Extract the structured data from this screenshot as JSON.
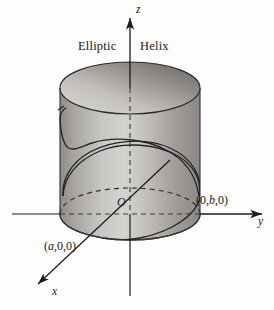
{
  "figure": {
    "title_part_1": "Elliptic",
    "title_part_2": "Helix",
    "background_color": "#fdfdfc",
    "ink_color": "#1b1b1b"
  },
  "axes": {
    "z_label": "z",
    "y_label": "y",
    "x_label": "x",
    "origin_label": "O"
  },
  "points": [
    {
      "name": "y-intercept",
      "label_prefix": "(0,",
      "label_var": "b",
      "label_suffix": ",0)",
      "label_full": "(0,b,0)"
    },
    {
      "name": "x-intercept",
      "label_prefix": "(",
      "label_var": "a",
      "label_suffix": ",0,0)",
      "label_full": "(a,0,0)"
    }
  ],
  "surface": {
    "name": "elliptic-cylinder",
    "fill_light": "#d6d4d1",
    "fill_mid": "#b4b1ae",
    "fill_dark": "#8f8c89",
    "top_cap_light": "#cfcdc9",
    "top_cap_dark": "#6e6b68"
  },
  "curve": {
    "name": "elliptic-helix-curve",
    "stroke": "#252525"
  }
}
